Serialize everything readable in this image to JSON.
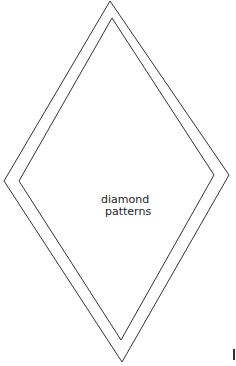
{
  "diagram": {
    "type": "nested-diamond-outline",
    "label_lines": [
      "diamond",
      "patterns"
    ],
    "stroke_color": "#333333",
    "background_color": "#ffffff",
    "outer_diamond": {
      "top": [
        110,
        1
      ],
      "right": [
        229,
        175
      ],
      "bottom": [
        122,
        362
      ],
      "left": [
        4,
        181
      ]
    },
    "inner_diamond": {
      "top": [
        112,
        18
      ],
      "right": [
        214,
        175
      ],
      "bottom": [
        121,
        340
      ],
      "left": [
        19,
        181
      ]
    }
  }
}
